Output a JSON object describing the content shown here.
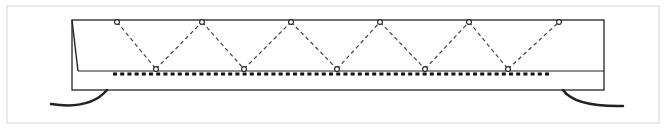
{
  "diagram": {
    "title": "",
    "frame": {
      "x": 7,
      "y": 6,
      "w": 652,
      "h": 117,
      "stroke": "#d4d4d4"
    },
    "colors": {
      "line": "#222222",
      "dashed": "#444444",
      "dotted": "#111111",
      "node_fill": "#ffffff"
    },
    "outer_rect": {
      "left": 72,
      "top": 20,
      "right": 604,
      "bottom": 90
    },
    "inner_line": {
      "x1": 78,
      "y1": 71,
      "x2": 604,
      "y2": 71
    },
    "slant_line": {
      "x1": 72,
      "y1": 20,
      "x2": 78,
      "y2": 71
    },
    "dotted_line": {
      "x1": 113,
      "y1": 74,
      "x2": 551,
      "y2": 74
    },
    "top_nodes": [
      {
        "x": 117,
        "y": 22
      },
      {
        "x": 202,
        "y": 22
      },
      {
        "x": 291,
        "y": 22
      },
      {
        "x": 380,
        "y": 22
      },
      {
        "x": 469,
        "y": 22
      },
      {
        "x": 559,
        "y": 22
      }
    ],
    "bottom_nodes": [
      {
        "x": 156,
        "y": 69
      },
      {
        "x": 244,
        "y": 69
      },
      {
        "x": 337,
        "y": 69
      },
      {
        "x": 425,
        "y": 69
      },
      {
        "x": 508,
        "y": 69
      }
    ],
    "left_curve": "M 107 90 Q 90 110 51 104",
    "right_curve": "M 563 90 Q 575 107 623 106"
  }
}
